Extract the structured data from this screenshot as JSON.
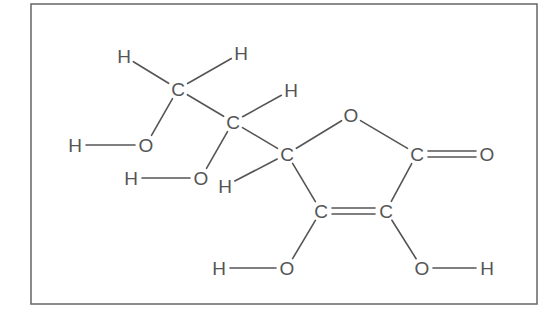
{
  "colors": {
    "ink": "#555555",
    "frame": "#6e6e6e",
    "background": "#ffffff"
  },
  "atoms": [
    {
      "id": "H1",
      "label": "H",
      "x": 124,
      "y": 56
    },
    {
      "id": "H2",
      "label": "H",
      "x": 241,
      "y": 53
    },
    {
      "id": "C1",
      "label": "C",
      "x": 178,
      "y": 89
    },
    {
      "id": "H3",
      "label": "H",
      "x": 291,
      "y": 90
    },
    {
      "id": "C2",
      "label": "C",
      "x": 233,
      "y": 122
    },
    {
      "id": "H4",
      "label": "H",
      "x": 75,
      "y": 145
    },
    {
      "id": "O1",
      "label": "O",
      "x": 146,
      "y": 145
    },
    {
      "id": "H5",
      "label": "H",
      "x": 131,
      "y": 178
    },
    {
      "id": "O2",
      "label": "O",
      "x": 201,
      "y": 178
    },
    {
      "id": "C3",
      "label": "C",
      "x": 287,
      "y": 154
    },
    {
      "id": "H6",
      "label": "H",
      "x": 225,
      "y": 186
    },
    {
      "id": "O5",
      "label": "O",
      "x": 351,
      "y": 115
    },
    {
      "id": "C4",
      "label": "C",
      "x": 417,
      "y": 154
    },
    {
      "id": "O6",
      "label": "O",
      "x": 487,
      "y": 154
    },
    {
      "id": "C5",
      "label": "C",
      "x": 321,
      "y": 211
    },
    {
      "id": "C6",
      "label": "C",
      "x": 386,
      "y": 211
    },
    {
      "id": "H7",
      "label": "H",
      "x": 219,
      "y": 268
    },
    {
      "id": "O3",
      "label": "O",
      "x": 287,
      "y": 268
    },
    {
      "id": "O4",
      "label": "O",
      "x": 422,
      "y": 268
    },
    {
      "id": "H8",
      "label": "H",
      "x": 487,
      "y": 268
    }
  ],
  "bonds": [
    {
      "from": "H1",
      "to": "C1",
      "order": 1
    },
    {
      "from": "H2",
      "to": "C1",
      "order": 1
    },
    {
      "from": "C1",
      "to": "C2",
      "order": 1
    },
    {
      "from": "C1",
      "to": "O1",
      "order": 1
    },
    {
      "from": "H4",
      "to": "O1",
      "order": 1
    },
    {
      "from": "C2",
      "to": "H3",
      "order": 1
    },
    {
      "from": "C2",
      "to": "O2",
      "order": 1
    },
    {
      "from": "H5",
      "to": "O2",
      "order": 1
    },
    {
      "from": "C2",
      "to": "C3",
      "order": 1
    },
    {
      "from": "C3",
      "to": "H6",
      "order": 1
    },
    {
      "from": "C3",
      "to": "O5",
      "order": 1
    },
    {
      "from": "O5",
      "to": "C4",
      "order": 1
    },
    {
      "from": "C4",
      "to": "O6",
      "order": 2
    },
    {
      "from": "C3",
      "to": "C5",
      "order": 1
    },
    {
      "from": "C4",
      "to": "C6",
      "order": 1
    },
    {
      "from": "C5",
      "to": "C6",
      "order": 2
    },
    {
      "from": "C5",
      "to": "O3",
      "order": 1
    },
    {
      "from": "H7",
      "to": "O3",
      "order": 1
    },
    {
      "from": "C6",
      "to": "O4",
      "order": 1
    },
    {
      "from": "O4",
      "to": "H8",
      "order": 1
    }
  ],
  "frame": {
    "x": 31,
    "y": 4,
    "width": 506,
    "height": 300
  }
}
